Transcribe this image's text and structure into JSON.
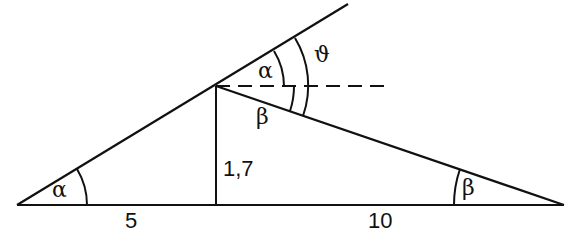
{
  "diagram": {
    "labels": {
      "alpha_bottom": "α",
      "alpha_top": "α",
      "theta": "ϑ",
      "beta_apex": "β",
      "beta_right": "β",
      "height": "1,7",
      "base_left": "5",
      "base_right": "10"
    },
    "colors": {
      "stroke": "#111111",
      "background": "#ffffff"
    }
  }
}
